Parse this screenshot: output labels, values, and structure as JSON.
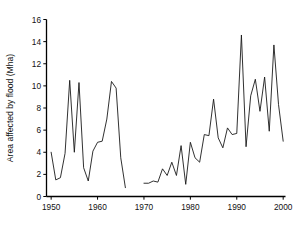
{
  "chart_data": {
    "type": "line",
    "title": "",
    "xlabel": "",
    "ylabel": "Area affected by flood (Mha)",
    "xlim": [
      1949,
      2000.5
    ],
    "ylim": [
      0,
      16
    ],
    "xticks": [
      1950,
      1960,
      1970,
      1980,
      1990,
      2000
    ],
    "yticks": [
      0,
      2,
      4,
      6,
      8,
      10,
      12,
      14,
      16
    ],
    "xtick_labels": [
      "1950",
      "1960",
      "1970",
      "1980",
      "1990",
      "2000"
    ],
    "ytick_labels": [
      "0",
      "2",
      "4",
      "6",
      "8",
      "10",
      "12",
      "14",
      "16"
    ],
    "grid": false,
    "legend": false,
    "line_color": "#1a1a1a",
    "background_color": "#ffffff",
    "note": "Two disjoint line segments with a data gap between 1967 and 1969",
    "series": [
      {
        "name": "Area affected by flood 1950-1966",
        "x": [
          1950,
          1951,
          1952,
          1953,
          1954,
          1955,
          1956,
          1957,
          1958,
          1959,
          1960,
          1961,
          1962,
          1963,
          1964,
          1965,
          1966
        ],
        "values": [
          4.0,
          1.5,
          1.7,
          3.9,
          10.5,
          4.0,
          10.3,
          2.6,
          1.4,
          4.1,
          4.9,
          5.0,
          7.0,
          10.4,
          9.8,
          3.5,
          0.8
        ]
      },
      {
        "name": "Area affected by flood 1970-2000",
        "x": [
          1970,
          1971,
          1972,
          1973,
          1974,
          1975,
          1976,
          1977,
          1978,
          1979,
          1980,
          1981,
          1982,
          1983,
          1984,
          1985,
          1986,
          1987,
          1988,
          1989,
          1990,
          1991,
          1992,
          1993,
          1994,
          1995,
          1996,
          1997,
          1998,
          1999,
          2000
        ],
        "values": [
          1.2,
          1.2,
          1.4,
          1.3,
          2.5,
          1.9,
          3.1,
          1.9,
          4.6,
          1.1,
          4.9,
          3.5,
          3.1,
          5.6,
          5.5,
          8.8,
          5.3,
          4.4,
          6.2,
          5.6,
          5.7,
          14.6,
          4.5,
          9.1,
          10.6,
          7.7,
          10.8,
          5.9,
          13.7,
          8.3,
          5.0
        ]
      }
    ]
  }
}
